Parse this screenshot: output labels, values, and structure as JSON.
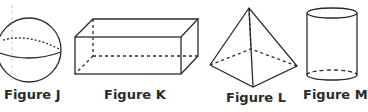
{
  "figures": [
    {
      "id": "J",
      "label": "Figure J",
      "shape": "sphere"
    },
    {
      "id": "K",
      "label": "Figure K",
      "shape": "rectangular-prism"
    },
    {
      "id": "L",
      "label": "Figure L",
      "shape": "square-pyramid"
    },
    {
      "id": "M",
      "label": "Figure M",
      "shape": "cylinder"
    }
  ],
  "colors": {
    "stroke": "#2b2b2b",
    "background": "#ffffff"
  }
}
